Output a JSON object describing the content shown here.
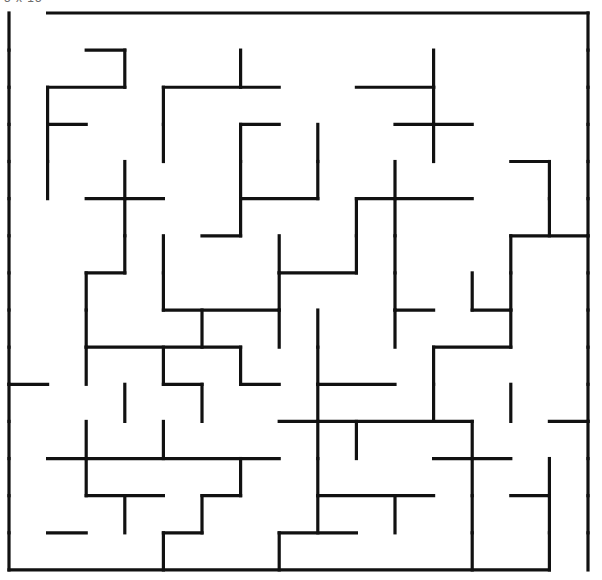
{
  "page": {
    "width": 602,
    "height": 580,
    "background_color": "#ffffff",
    "clipped_top_label": "5 x 15"
  },
  "maze": {
    "type": "rectangular-grid-maze",
    "columns": 15,
    "rows": 15,
    "cell_width": 38.6,
    "cell_height": 37.13,
    "origin_x": 9,
    "origin_y": 13,
    "wall_color": "#111111",
    "wall_thickness": 3.2,
    "entrance": {
      "side": "top",
      "column": 0,
      "label": "entrance"
    },
    "exit": {
      "side": "bottom",
      "column": 14,
      "label": "exit"
    },
    "h_walls": [
      [
        0,
        1,
        1,
        1,
        1,
        1,
        1,
        1,
        1,
        1,
        1,
        1,
        1,
        1,
        1
      ],
      [
        0,
        0,
        1,
        0,
        0,
        0,
        0,
        0,
        0,
        0,
        0,
        0,
        0,
        0,
        0
      ],
      [
        0,
        1,
        1,
        0,
        1,
        1,
        1,
        0,
        0,
        1,
        1,
        0,
        0,
        0,
        0
      ],
      [
        0,
        1,
        0,
        0,
        0,
        0,
        1,
        0,
        0,
        0,
        1,
        1,
        0,
        0,
        0
      ],
      [
        0,
        0,
        0,
        0,
        0,
        0,
        0,
        0,
        0,
        0,
        0,
        0,
        0,
        1,
        0
      ],
      [
        0,
        0,
        1,
        1,
        0,
        0,
        1,
        1,
        0,
        1,
        1,
        1,
        0,
        0,
        0
      ],
      [
        0,
        0,
        0,
        0,
        0,
        1,
        0,
        0,
        0,
        0,
        0,
        0,
        0,
        1,
        1
      ],
      [
        0,
        0,
        1,
        0,
        0,
        0,
        0,
        1,
        1,
        0,
        0,
        0,
        0,
        0,
        0
      ],
      [
        0,
        0,
        0,
        0,
        1,
        1,
        1,
        0,
        0,
        0,
        1,
        0,
        1,
        0,
        0
      ],
      [
        0,
        0,
        1,
        1,
        1,
        1,
        0,
        0,
        0,
        0,
        0,
        1,
        1,
        0,
        0
      ],
      [
        1,
        0,
        0,
        0,
        1,
        0,
        1,
        0,
        1,
        1,
        0,
        0,
        0,
        0,
        0
      ],
      [
        0,
        0,
        0,
        0,
        0,
        0,
        0,
        1,
        1,
        1,
        1,
        1,
        0,
        0,
        1
      ],
      [
        0,
        1,
        1,
        1,
        1,
        1,
        1,
        0,
        0,
        0,
        0,
        1,
        1,
        0,
        0
      ],
      [
        0,
        0,
        1,
        1,
        0,
        1,
        0,
        0,
        1,
        1,
        1,
        0,
        0,
        1,
        0
      ],
      [
        0,
        1,
        0,
        0,
        1,
        0,
        0,
        1,
        1,
        0,
        0,
        0,
        0,
        0,
        0
      ],
      [
        1,
        1,
        1,
        1,
        1,
        1,
        1,
        1,
        1,
        1,
        1,
        1,
        1,
        1,
        0
      ]
    ],
    "v_walls": [
      [
        1,
        0,
        0,
        0,
        0,
        0,
        0,
        0,
        0,
        0,
        0,
        0,
        0,
        0,
        0,
        1
      ],
      [
        1,
        0,
        0,
        1,
        0,
        0,
        1,
        0,
        0,
        0,
        0,
        1,
        0,
        0,
        0,
        1
      ],
      [
        1,
        1,
        0,
        0,
        1,
        0,
        0,
        0,
        0,
        0,
        0,
        1,
        0,
        0,
        0,
        1
      ],
      [
        1,
        1,
        0,
        0,
        1,
        0,
        1,
        0,
        1,
        0,
        0,
        1,
        0,
        0,
        0,
        1
      ],
      [
        1,
        1,
        0,
        1,
        0,
        0,
        1,
        0,
        1,
        0,
        1,
        0,
        0,
        0,
        1,
        1
      ],
      [
        1,
        0,
        0,
        1,
        0,
        0,
        1,
        0,
        0,
        1,
        1,
        0,
        0,
        0,
        1,
        1
      ],
      [
        1,
        0,
        0,
        1,
        1,
        0,
        0,
        1,
        0,
        1,
        1,
        0,
        0,
        1,
        0,
        1
      ],
      [
        1,
        0,
        1,
        0,
        1,
        0,
        0,
        1,
        0,
        0,
        1,
        0,
        1,
        1,
        0,
        1
      ],
      [
        1,
        0,
        1,
        0,
        0,
        1,
        0,
        1,
        1,
        0,
        1,
        0,
        0,
        1,
        0,
        1
      ],
      [
        1,
        0,
        1,
        0,
        1,
        0,
        1,
        0,
        1,
        0,
        0,
        1,
        0,
        0,
        0,
        1
      ],
      [
        1,
        0,
        0,
        1,
        0,
        1,
        0,
        0,
        1,
        0,
        0,
        1,
        0,
        1,
        0,
        1
      ],
      [
        1,
        0,
        1,
        0,
        1,
        0,
        0,
        0,
        1,
        1,
        0,
        0,
        1,
        0,
        0,
        1
      ],
      [
        1,
        0,
        1,
        0,
        0,
        0,
        1,
        0,
        1,
        0,
        0,
        0,
        1,
        0,
        1,
        1
      ],
      [
        1,
        0,
        0,
        1,
        0,
        1,
        0,
        0,
        1,
        0,
        1,
        0,
        1,
        0,
        1,
        1
      ],
      [
        1,
        0,
        0,
        0,
        1,
        0,
        0,
        1,
        0,
        0,
        0,
        0,
        1,
        0,
        1,
        1
      ]
    ]
  }
}
